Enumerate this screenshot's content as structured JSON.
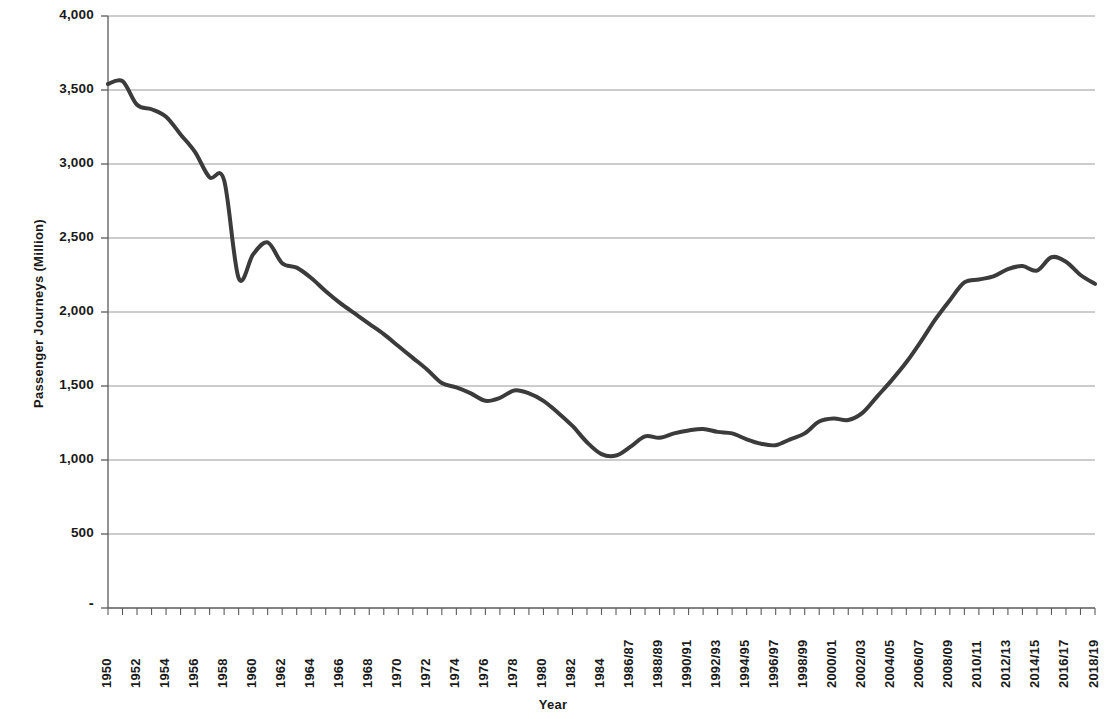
{
  "chart_data": {
    "type": "line",
    "title": "",
    "xlabel": "Year",
    "ylabel": "Passenger Journeys (Million)",
    "ylim": [
      0,
      4000
    ],
    "ytick_values": [
      0,
      500,
      1000,
      1500,
      2000,
      2500,
      3000,
      3500,
      4000
    ],
    "ytick_labels": [
      "-",
      "500",
      "1,000",
      "1,500",
      "2,000",
      "2,500",
      "3,000",
      "3,500",
      "4,000"
    ],
    "grid": true,
    "legend": "none",
    "line_color": "#3b3b3b",
    "line_width": 4,
    "x": [
      "1950",
      "1951",
      "1952",
      "1953",
      "1954",
      "1955",
      "1956",
      "1957",
      "1958",
      "1959",
      "1960",
      "1961",
      "1962",
      "1963",
      "1964",
      "1965",
      "1966",
      "1967",
      "1968",
      "1969",
      "1970",
      "1971",
      "1972",
      "1973",
      "1974",
      "1975",
      "1976",
      "1977",
      "1978",
      "1979",
      "1980",
      "1981",
      "1982",
      "1983",
      "1984",
      "1985/86",
      "1986/87",
      "1987/88",
      "1988/89",
      "1989/90",
      "1990/91",
      "1991/92",
      "1992/93",
      "1993/94",
      "1994/95",
      "1995/96",
      "1996/97",
      "1997/98",
      "1998/99",
      "1999/00",
      "2000/01",
      "2001/02",
      "2002/03",
      "2003/04",
      "2004/05",
      "2005/06",
      "2006/07",
      "2007/08",
      "2008/09",
      "2009/10",
      "2010/11",
      "2011/12",
      "2012/13",
      "2013/14",
      "2014/15",
      "2015/16",
      "2016/17",
      "2017/18",
      "2018/19"
    ],
    "values": [
      3540,
      3560,
      3400,
      3370,
      3320,
      3200,
      3080,
      2910,
      2890,
      2230,
      2390,
      2470,
      2330,
      2300,
      2230,
      2140,
      2060,
      1990,
      1920,
      1850,
      1770,
      1690,
      1610,
      1520,
      1490,
      1450,
      1400,
      1420,
      1470,
      1450,
      1400,
      1320,
      1230,
      1120,
      1040,
      1030,
      1090,
      1160,
      1150,
      1180,
      1200,
      1210,
      1190,
      1180,
      1140,
      1110,
      1100,
      1140,
      1180,
      1260,
      1280,
      1270,
      1320,
      1430,
      1540,
      1660,
      1800,
      1950,
      2080,
      2200,
      2220,
      2240,
      2290,
      2310,
      2280,
      2370,
      2340,
      2250,
      2190
    ],
    "xtick_labels_visible": [
      "1950",
      "1952",
      "1954",
      "1956",
      "1958",
      "1960",
      "1962",
      "1964",
      "1966",
      "1968",
      "1970",
      "1972",
      "1974",
      "1976",
      "1978",
      "1980",
      "1982",
      "1984",
      "1986/87",
      "1988/89",
      "1990/91",
      "1992/93",
      "1994/95",
      "1996/97",
      "1998/99",
      "2000/01",
      "2002/03",
      "2004/05",
      "2006/07",
      "2008/09",
      "2010/11",
      "2012/13",
      "2014/15",
      "2016/17",
      "2018/19"
    ]
  }
}
